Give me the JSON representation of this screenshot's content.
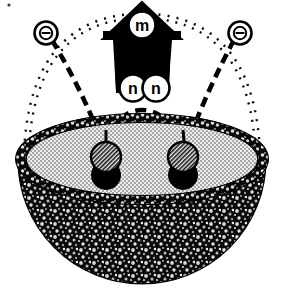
{
  "figure": {
    "background_color": "#ffffff",
    "ink_color": "#000000",
    "width": 285,
    "height": 299
  },
  "labels": {
    "arrow_label": "m",
    "pair_label_left": "n",
    "pair_label_right": "n",
    "theta_left": "Θ",
    "theta_right": "Θ"
  },
  "elements": {
    "arrow": {
      "name": "upward-arrow",
      "direction": "up",
      "fill": "#000000",
      "label": "m"
    },
    "bowl": {
      "name": "hemisphere-bowl",
      "rim_color": "#111111",
      "inner_fill": "#d9d9d9",
      "outer_fill": "#1a1a1a",
      "inner_pattern": "halftone-check",
      "outer_pattern": "granular-speckle"
    },
    "particles": [
      {
        "name": "particle-pair-left",
        "top_sphere": "hatched",
        "bottom_sphere": "solid-black",
        "cx": 106,
        "cy": 160
      },
      {
        "name": "particle-pair-right",
        "top_sphere": "hatched",
        "bottom_sphere": "solid-black",
        "cx": 183,
        "cy": 160
      }
    ],
    "arcs": [
      {
        "name": "outer-dashed-arc",
        "style": "railroad-dashed",
        "color": "#000000"
      },
      {
        "name": "inner-dashed-arc-nn",
        "style": "dashed",
        "color": "#000000"
      },
      {
        "name": "theta-leader-left",
        "style": "bold-dashed",
        "color": "#000000"
      },
      {
        "name": "theta-leader-right",
        "style": "bold-dashed",
        "color": "#000000"
      }
    ]
  },
  "colors": {
    "ink": "#000000",
    "paper": "#ffffff",
    "inner_gray": "#d9d9d9",
    "outer_dark": "#1a1a1a"
  }
}
